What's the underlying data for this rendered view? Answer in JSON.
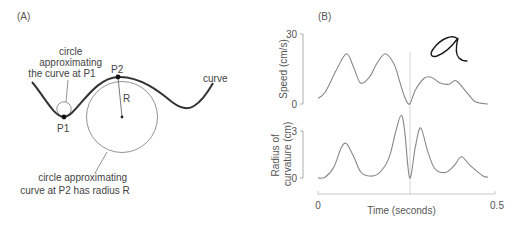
{
  "panel_a": {
    "label": "(A)",
    "curve_label": "curve",
    "p1_label": "P1",
    "p2_label": "P2",
    "radius_label": "R",
    "annotation_p1": [
      "circle",
      "approximating",
      "the curve at P1"
    ],
    "annotation_p2": [
      "circle approximating",
      "curve at P2 has radius R"
    ],
    "colors": {
      "curve": "#333333",
      "circle": "#777777",
      "text": "#444444"
    }
  },
  "panel_b": {
    "label": "(B)",
    "handwriting_glyph": "a"
  },
  "chart_data": [
    {
      "type": "line",
      "title": "",
      "xlabel": "Time (seconds)",
      "ylabel": "Speed  (cm/s)",
      "xlim": [
        0,
        0.5
      ],
      "ylim": [
        0,
        30
      ],
      "yticks": [
        "0",
        "30"
      ],
      "grid": false,
      "marker_time": 0.26,
      "series": [
        {
          "name": "speed",
          "color": "#888888",
          "x": [
            0.0,
            0.02,
            0.05,
            0.08,
            0.1,
            0.12,
            0.145,
            0.165,
            0.19,
            0.215,
            0.23,
            0.245,
            0.259,
            0.275,
            0.3,
            0.32,
            0.345,
            0.37,
            0.39,
            0.42,
            0.445,
            0.48
          ],
          "y": [
            2.5,
            5,
            14,
            21.5,
            16,
            9,
            11.5,
            17,
            21.5,
            17,
            10,
            3,
            0,
            6,
            11,
            11.5,
            9,
            8.5,
            10,
            5,
            1,
            0
          ]
        }
      ]
    },
    {
      "type": "line",
      "title": "",
      "xlabel": "Time (seconds)",
      "ylabel": "Radius of curvature (cm)",
      "xlim": [
        0,
        0.5
      ],
      "ylim": [
        0,
        3
      ],
      "yticks": [
        "0",
        "3"
      ],
      "xticks": [
        "0",
        "0.5"
      ],
      "grid": false,
      "marker_time": 0.26,
      "series": [
        {
          "name": "radius_of_curvature",
          "color": "#888888",
          "x": [
            0.0,
            0.02,
            0.045,
            0.065,
            0.08,
            0.1,
            0.12,
            0.14,
            0.165,
            0.19,
            0.205,
            0.22,
            0.235,
            0.245,
            0.259,
            0.275,
            0.29,
            0.31,
            0.33,
            0.36,
            0.385,
            0.405,
            0.43,
            0.465,
            0.48
          ],
          "y": [
            0,
            0.05,
            0.7,
            1.9,
            2.2,
            1.4,
            0.4,
            0.15,
            0.2,
            0.8,
            1.6,
            3.0,
            4.0,
            3.0,
            0,
            2.0,
            3.2,
            1.7,
            0.6,
            0.35,
            0.8,
            1.35,
            0.8,
            0.15,
            0.05
          ]
        }
      ]
    }
  ]
}
